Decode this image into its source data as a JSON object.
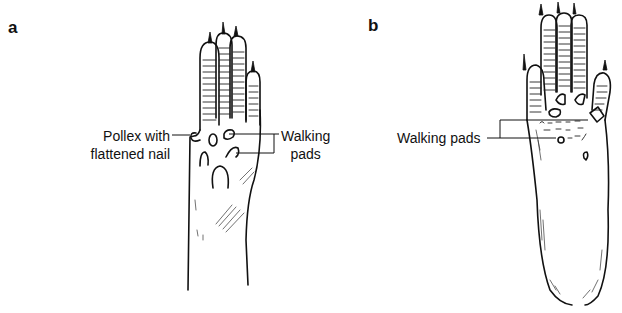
{
  "figure": {
    "panels": [
      {
        "id": "a",
        "label": "a",
        "annotations": {
          "pollex": {
            "line1": "Pollex with",
            "line2": "flattened nail"
          },
          "walking_pads": {
            "line1": "Walking",
            "line2": "pads"
          }
        }
      },
      {
        "id": "b",
        "label": "b",
        "annotations": {
          "walking_pads": {
            "text": "Walking pads"
          }
        }
      }
    ]
  }
}
